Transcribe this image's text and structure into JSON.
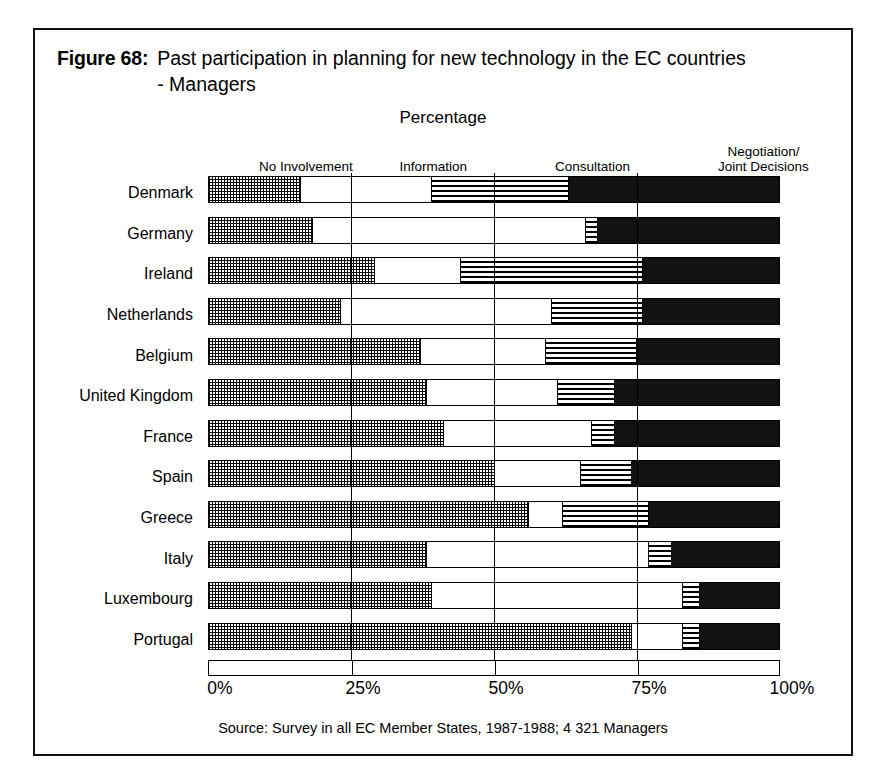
{
  "figure": {
    "label": "Figure 68:",
    "title": "Past  participation in planning for new technology in the EC countries - Managers",
    "axis_caption": "Percentage",
    "source": "Source: Survey in all EC Member States, 1987-1988; 4 321 Managers"
  },
  "chart_data": {
    "type": "bar",
    "orientation": "horizontal",
    "stacked": true,
    "title": "Past  participation in planning for new technology in the EC countries - Managers",
    "subtitle": "Percentage",
    "xlabel": "Percentage",
    "ylabel": "",
    "xlim": [
      0,
      100
    ],
    "xticks": [
      0,
      25,
      50,
      75,
      100
    ],
    "xticklabels": [
      "0%",
      "25%",
      "50%",
      "75%",
      "100%"
    ],
    "grid": true,
    "legend_position": "top",
    "categories": [
      "Denmark",
      "Germany",
      "Ireland",
      "Netherlands",
      "Belgium",
      "United Kingdom",
      "France",
      "Spain",
      "Greece",
      "Italy",
      "Luxembourg",
      "Portugal"
    ],
    "series": [
      {
        "name": "No Involvement",
        "fill": "checker-grey",
        "values": [
          16,
          18,
          29,
          23,
          37,
          38,
          41,
          50,
          56,
          38,
          39,
          74
        ]
      },
      {
        "name": "Information",
        "fill": "white",
        "values": [
          23,
          48,
          15,
          37,
          22,
          23,
          26,
          15,
          6,
          39,
          44,
          9
        ]
      },
      {
        "name": "Consultation",
        "fill": "horizontal-stripes",
        "values": [
          24,
          2,
          32,
          16,
          16,
          10,
          4,
          9,
          15,
          4,
          3,
          3
        ]
      },
      {
        "name": "Negotiation/Joint Decisions",
        "fill": "solid-black",
        "values": [
          37,
          32,
          24,
          24,
          25,
          29,
          29,
          26,
          23,
          19,
          14,
          14
        ]
      }
    ]
  },
  "legend": {
    "items": [
      {
        "label": "No Involvement",
        "left_pct": 4,
        "width_px": 150
      },
      {
        "label": "Information",
        "left_pct": 28,
        "width_px": 130
      },
      {
        "label": "Consultation",
        "left_pct": 55,
        "width_px": 140
      },
      {
        "label": "Negotiation/\nJoint Decisions",
        "left_pct": 84,
        "width_px": 150
      }
    ]
  },
  "colors": {
    "ink": "#000000",
    "paper": "#ffffff",
    "negotiation_fill": "#121212"
  }
}
